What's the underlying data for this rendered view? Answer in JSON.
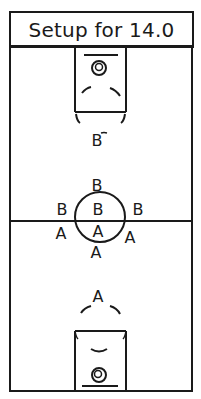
{
  "title": "Setup for 14.0",
  "court": {
    "line_color": "#1a1a1a",
    "background": "#ffffff"
  },
  "players": {
    "top_lane_b": "B",
    "center_top_b": "B",
    "center_left_b": "B",
    "center_middle_b": "B",
    "center_right_b": "B",
    "center_left_a": "A",
    "center_middle_a": "A",
    "center_right_a": "A",
    "center_bottom_a": "A",
    "bottom_lane_a": "A"
  }
}
